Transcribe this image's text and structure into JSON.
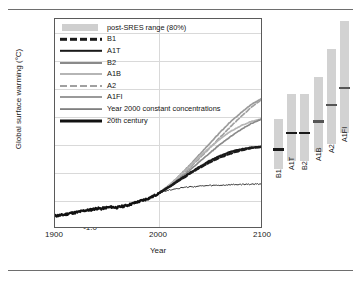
{
  "chart_data": {
    "type": "line",
    "title": "",
    "xlabel": "Year",
    "ylabel": "Global surface warming (°C)",
    "xlim": [
      1900,
      2100
    ],
    "ylim": [
      -1.0,
      6.5
    ],
    "xticks": [
      1900,
      2000,
      2100
    ],
    "yticks": [
      "-1.0",
      "0.0",
      "1.0",
      "2.0",
      "3.0",
      "4.0",
      "5.0",
      "6.0"
    ],
    "ytick_values": [
      -1.0,
      0.0,
      1.0,
      2.0,
      3.0,
      4.0,
      5.0,
      6.0
    ],
    "grid": true,
    "legend_position": "top-left",
    "legend": [
      {
        "label": "post-SRES range (80%)",
        "style": "swatch",
        "color": "#cfcfcf"
      },
      {
        "label": "B1",
        "style": "dashed",
        "color": "#1a1a1a",
        "width": 2.4
      },
      {
        "label": "A1T",
        "style": "solid",
        "color": "#1a1a1a",
        "width": 2.4
      },
      {
        "label": "B2",
        "style": "solid",
        "color": "#8a8a8a",
        "width": 2.0
      },
      {
        "label": "A1B",
        "style": "solid",
        "color": "#b5b5b5",
        "width": 2.0
      },
      {
        "label": "A2",
        "style": "dashed",
        "color": "#a0a0a0",
        "width": 2.0
      },
      {
        "label": "A1FI",
        "style": "solid",
        "color": "#9a9a9a",
        "width": 2.0
      },
      {
        "label": "Year 2000 constant concentrations",
        "style": "solid",
        "color": "#1a1a1a",
        "width": 0.9
      },
      {
        "label": "20th century",
        "style": "solid",
        "color": "#111111",
        "width": 3.0
      }
    ],
    "series": [
      {
        "name": "20th century",
        "color": "#111111",
        "x": [
          1900,
          1905,
          1910,
          1915,
          1920,
          1925,
          1930,
          1935,
          1940,
          1945,
          1950,
          1955,
          1960,
          1965,
          1970,
          1975,
          1980,
          1985,
          1990,
          1995,
          2000
        ],
        "values": [
          -0.6,
          -0.58,
          -0.55,
          -0.5,
          -0.48,
          -0.44,
          -0.4,
          -0.38,
          -0.33,
          -0.34,
          -0.3,
          -0.28,
          -0.3,
          -0.26,
          -0.22,
          -0.16,
          -0.1,
          -0.04,
          0.02,
          0.1,
          0.2
        ]
      },
      {
        "name": "Year 2000 constant concentrations",
        "color": "#1a1a1a",
        "x": [
          2000,
          2010,
          2020,
          2030,
          2040,
          2050,
          2060,
          2070,
          2080,
          2090,
          2100
        ],
        "values": [
          0.2,
          0.33,
          0.4,
          0.44,
          0.47,
          0.49,
          0.5,
          0.52,
          0.53,
          0.54,
          0.55
        ]
      },
      {
        "name": "B1",
        "color": "#1a1a1a",
        "x": [
          2000,
          2010,
          2020,
          2030,
          2040,
          2050,
          2060,
          2070,
          2080,
          2090,
          2100
        ],
        "values": [
          0.2,
          0.42,
          0.66,
          0.9,
          1.12,
          1.32,
          1.5,
          1.64,
          1.76,
          1.84,
          1.88
        ]
      },
      {
        "name": "A1T",
        "color": "#1a1a1a",
        "x": [
          2000,
          2010,
          2020,
          2030,
          2040,
          2050,
          2060,
          2070,
          2080,
          2090,
          2100
        ],
        "values": [
          0.2,
          0.43,
          0.68,
          0.93,
          1.16,
          1.38,
          1.56,
          1.7,
          1.8,
          1.86,
          1.9
        ]
      },
      {
        "name": "B2",
        "color": "#8a8a8a",
        "x": [
          2000,
          2010,
          2020,
          2030,
          2040,
          2050,
          2060,
          2070,
          2080,
          2090,
          2100
        ],
        "values": [
          0.2,
          0.45,
          0.72,
          1.02,
          1.34,
          1.66,
          1.97,
          2.25,
          2.5,
          2.72,
          2.88
        ]
      },
      {
        "name": "A1B",
        "color": "#b5b5b5",
        "x": [
          2000,
          2010,
          2020,
          2030,
          2040,
          2050,
          2060,
          2070,
          2080,
          2090,
          2100
        ],
        "values": [
          0.2,
          0.48,
          0.8,
          1.16,
          1.52,
          1.86,
          2.16,
          2.44,
          2.64,
          2.8,
          2.9
        ]
      },
      {
        "name": "A2",
        "color": "#a0a0a0",
        "x": [
          2000,
          2010,
          2020,
          2030,
          2040,
          2050,
          2060,
          2070,
          2080,
          2090,
          2100
        ],
        "values": [
          0.2,
          0.46,
          0.76,
          1.1,
          1.46,
          1.84,
          2.22,
          2.6,
          2.96,
          3.3,
          3.58
        ]
      },
      {
        "name": "A1FI",
        "color": "#9a9a9a",
        "x": [
          2000,
          2010,
          2020,
          2030,
          2040,
          2050,
          2060,
          2070,
          2080,
          2090,
          2100
        ],
        "values": [
          0.2,
          0.48,
          0.82,
          1.2,
          1.6,
          2.0,
          2.4,
          2.78,
          3.1,
          3.4,
          3.62
        ]
      }
    ],
    "range_bars": {
      "note": "post-SRES range (80%) bars at right, with best-estimate marker",
      "bars": [
        {
          "label": "B1",
          "low": 1.1,
          "high": 2.9,
          "best": 1.8
        },
        {
          "label": "A1T",
          "low": 1.4,
          "high": 3.8,
          "best": 2.4
        },
        {
          "label": "B2",
          "low": 1.4,
          "high": 3.8,
          "best": 2.4
        },
        {
          "label": "A1B",
          "low": 1.7,
          "high": 4.4,
          "best": 2.8
        },
        {
          "label": "A2",
          "low": 2.0,
          "high": 5.4,
          "best": 3.4
        },
        {
          "label": "A1FI",
          "low": 2.4,
          "high": 6.4,
          "best": 4.0
        }
      ]
    }
  }
}
